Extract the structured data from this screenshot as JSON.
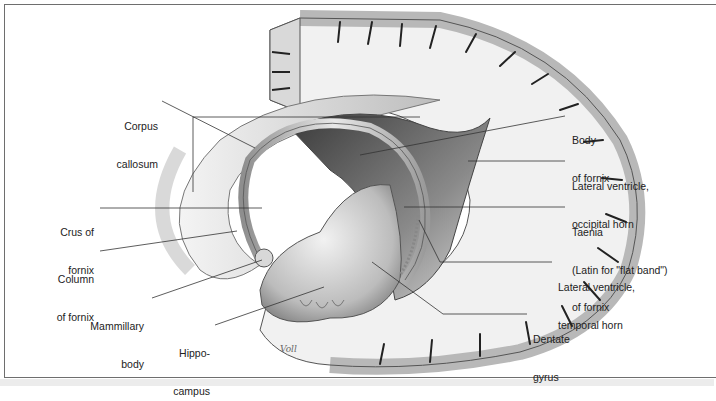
{
  "figure": {
    "type": "anatomical illustration",
    "signature": "Voll",
    "colors": {
      "frame": "#6e6e6e",
      "leader": "#333333",
      "text": "#222222",
      "cortex_gray": "#b9b9b9",
      "white_matter": "#efefef"
    }
  },
  "labels": {
    "corpus_callosum": {
      "line1": "Corpus",
      "line2": "callosum"
    },
    "crus_of_fornix": {
      "line1": "Crus of",
      "line2": "fornix"
    },
    "column_of_fornix": {
      "line1": "Column",
      "line2": "of fornix"
    },
    "mammillary_body": {
      "line1": "Mammillary",
      "line2": "body"
    },
    "hippocampus": {
      "line1": "Hippo-",
      "line2": "campus"
    },
    "body_of_fornix": {
      "line1": "Body",
      "line2": "of fornix"
    },
    "lateral_ventricle_occipital": {
      "line1": "Lateral ventricle,",
      "line2": "occipital horn"
    },
    "taenia": {
      "line1": "Taenia",
      "line2": "(Latin for \"flat band\")",
      "line3": "of fornix"
    },
    "lateral_ventricle_temporal": {
      "line1": "Lateral ventricle,",
      "line2": "temporal horn"
    },
    "dentate_gyrus": {
      "line1": "Dentate",
      "line2": "gyrus"
    }
  }
}
